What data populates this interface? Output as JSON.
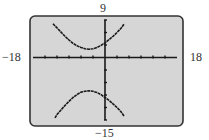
{
  "window": {
    "xmin_label": "−18",
    "xmax_label": "18",
    "ymax_label": "9",
    "ymin_label": "−15"
  },
  "colors": {
    "screen_fill": "#d6d6d6",
    "screen_border": "#333333",
    "curve": "#1a1a1a",
    "axis": "#1a1a1a"
  },
  "chart_data": {
    "type": "line",
    "title": "",
    "xlabel": "",
    "ylabel": "",
    "xlim": [
      -18,
      18
    ],
    "ylim": [
      -15,
      9
    ],
    "xscl": 3,
    "yscl": 3,
    "grid": false,
    "legend": null,
    "annotations": [
      "-18",
      "18",
      "9",
      "-15"
    ],
    "series": [
      {
        "name": "upper branch",
        "x": [
          -13,
          -12,
          -11,
          -10,
          -9,
          -8,
          -7,
          -6,
          -5,
          -4,
          -3,
          -2,
          -1,
          0,
          1,
          2,
          3,
          4,
          4.8
        ],
        "y": [
          8.1,
          7.1,
          6.1,
          5.1,
          4.2,
          3.4,
          2.8,
          2.4,
          2.1,
          2.0,
          2.1,
          2.4,
          2.9,
          3.5,
          4.3,
          5.1,
          6.0,
          7.0,
          8.1
        ]
      },
      {
        "name": "lower branch",
        "x": [
          -12.5,
          -12,
          -11,
          -10,
          -9,
          -8,
          -7,
          -6,
          -5,
          -4,
          -3,
          -2,
          -1,
          0,
          1,
          2,
          3,
          4,
          4.8
        ],
        "y": [
          -14.5,
          -13.7,
          -12.6,
          -11.5,
          -10.5,
          -9.6,
          -8.9,
          -8.3,
          -8.1,
          -8.0,
          -8.1,
          -8.4,
          -8.9,
          -9.6,
          -10.3,
          -11.1,
          -12.0,
          -13.0,
          -14.1
        ]
      }
    ]
  }
}
